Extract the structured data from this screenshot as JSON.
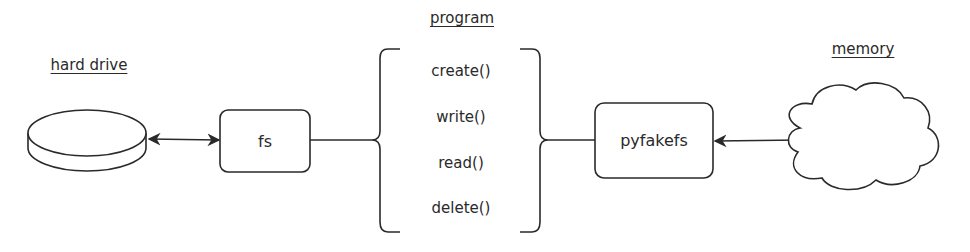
{
  "labels": {
    "hard_drive": "hard drive",
    "program": "program",
    "memory": "memory"
  },
  "nodes": {
    "fs": "fs",
    "pyfakefs": "pyfakefs"
  },
  "program_functions": [
    "create()",
    "write()",
    "read()",
    "delete()"
  ],
  "colors": {
    "stroke": "#2a2a2a",
    "background": "#ffffff"
  }
}
